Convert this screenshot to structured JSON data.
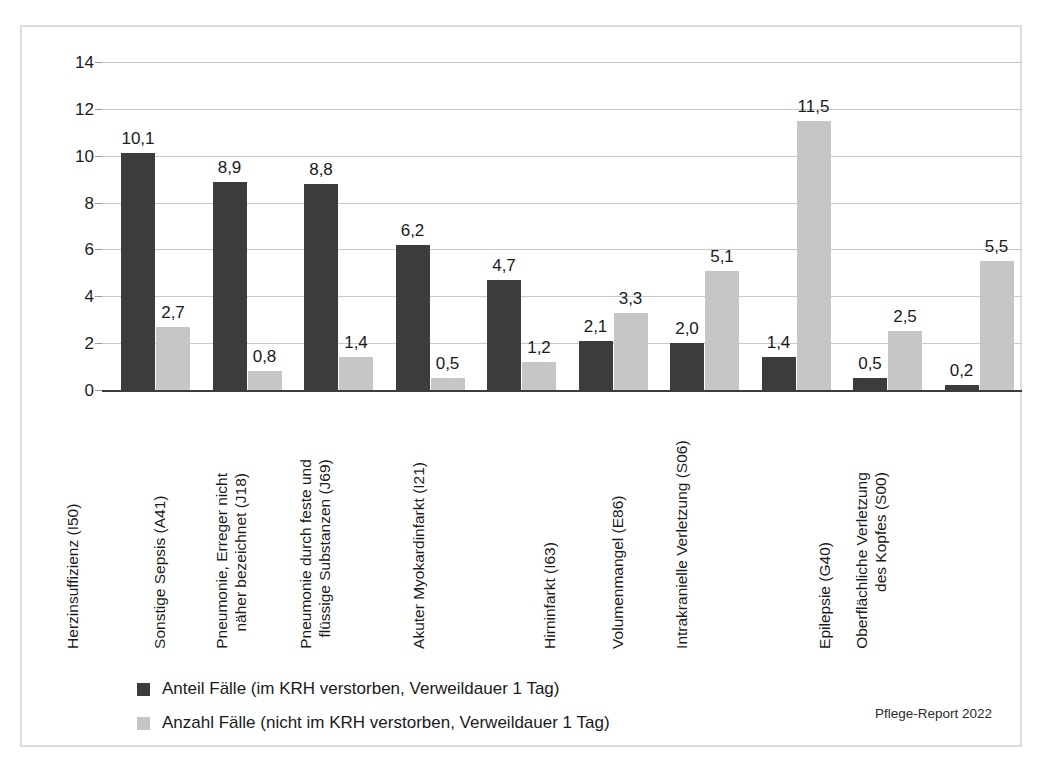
{
  "colors": {
    "series_dark": "#3c3c3c",
    "series_light": "#c6c6c6",
    "gridline": "#c9c9c9",
    "axis": "#3c3c3c",
    "frame": "#dcdcdc",
    "text": "#1a1a1a"
  },
  "credit": "Pflege-Report 2022",
  "legend": {
    "items": [
      {
        "label": "Anteil Fälle (im KRH verstorben, Verweildauer 1 Tag)",
        "color": "#3c3c3c"
      },
      {
        "label": "Anzahl Fälle (nicht im KRH verstorben, Verweildauer 1 Tag)",
        "color": "#c6c6c6"
      }
    ]
  },
  "chart_data": {
    "type": "bar",
    "title": "",
    "xlabel": "",
    "ylabel": "",
    "ylim": [
      0,
      14
    ],
    "yticks": [
      0,
      2,
      4,
      6,
      8,
      10,
      12,
      14
    ],
    "ytick_labels": [
      "0",
      "2",
      "4",
      "6",
      "8",
      "10",
      "12",
      "14"
    ],
    "grid": true,
    "legend_position": "bottom-left",
    "categories": [
      "Herzinsuffizienz (I50)",
      "Sonstige Sepsis (A41)",
      "Pneumonie, Erreger nicht näher bezeichnet (J18)",
      "Pneumonie durch feste und flüssige Substanzen (J69)",
      "Akuter Myokardinfarkt (I21)",
      "Hirninfarkt (I63)",
      "Volumenmangel (E86)",
      "Intrakranielle Verletzung (S06)",
      "Epilepsie (G40)",
      "Oberflächliche Verletzung des Kopfes (S00)"
    ],
    "category_lines": [
      [
        "Herzinsuffizienz (I50)"
      ],
      [
        "Sonstige Sepsis (A41)"
      ],
      [
        "Pneumonie, Erreger nicht",
        "näher bezeichnet (J18)"
      ],
      [
        "Pneumonie durch feste und",
        "flüssige Substanzen (J69)"
      ],
      [
        "Akuter Myokardinfarkt (I21)"
      ],
      [
        "Hirninfarkt (I63)"
      ],
      [
        "Volumenmangel (E86)"
      ],
      [
        "Intrakranielle Verletzung (S06)"
      ],
      [
        "Epilepsie (G40)"
      ],
      [
        "Oberflächliche Verletzung",
        "des Kopfes (S00)"
      ]
    ],
    "series": [
      {
        "name": "Anteil Fälle (im KRH verstorben, Verweildauer 1 Tag)",
        "color": "#3c3c3c",
        "values": [
          10.1,
          8.9,
          8.8,
          6.2,
          4.7,
          2.1,
          2.0,
          1.4,
          0.5,
          0.2
        ],
        "value_labels": [
          "10,1",
          "8,9",
          "8,8",
          "6,2",
          "4,7",
          "2,1",
          "2,0",
          "1,4",
          "0,5",
          "0,2"
        ]
      },
      {
        "name": "Anzahl Fälle (nicht im KRH verstorben, Verweildauer 1 Tag)",
        "color": "#c6c6c6",
        "values": [
          2.7,
          0.8,
          1.4,
          0.5,
          1.2,
          3.3,
          5.1,
          11.5,
          2.5,
          5.5
        ],
        "value_labels": [
          "2,7",
          "0,8",
          "1,4",
          "0,5",
          "1,2",
          "3,3",
          "5,1",
          "11,5",
          "2,5",
          "5,5"
        ]
      }
    ]
  }
}
